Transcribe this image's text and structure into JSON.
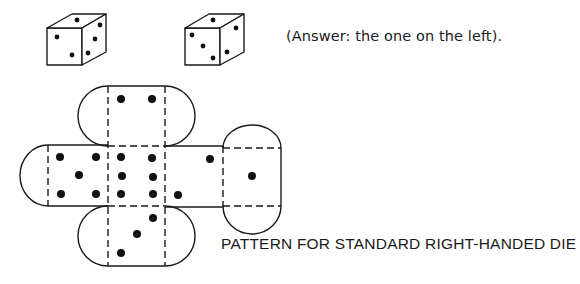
{
  "answer_text": "(Answer: the one on the left).",
  "pattern_title": "PATTERN FOR STANDARD  RIGHT-HANDED DIE",
  "colors": {
    "ink": "#1a1a1a",
    "background": "#ffffff"
  },
  "dice": [
    {
      "name": "left-die",
      "is_answer": true,
      "front_pips": 2,
      "top_pips": 1,
      "right_pips": 3
    },
    {
      "name": "right-die",
      "is_answer": false,
      "front_pips": 3,
      "top_pips": 1,
      "right_pips": 2
    }
  ],
  "net": {
    "faces": [
      {
        "name": "top-face",
        "pips": 2
      },
      {
        "name": "left-face",
        "pips": 5
      },
      {
        "name": "center-face",
        "pips": 6
      },
      {
        "name": "right-face",
        "pips": 2
      },
      {
        "name": "far-right-face",
        "pips": 1
      },
      {
        "name": "bottom-face",
        "pips": 3
      }
    ]
  }
}
